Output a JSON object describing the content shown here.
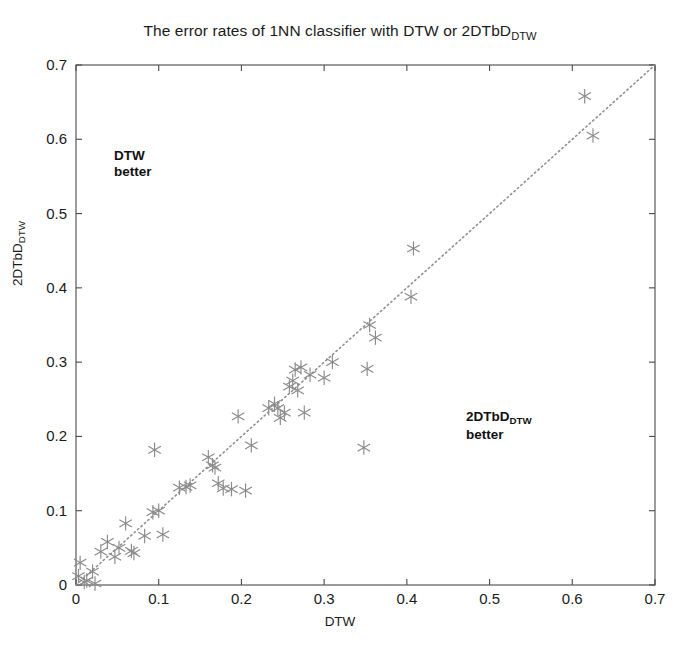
{
  "chart": {
    "title_prefix": "The error rates of 1NN classifier with DTW or 2DTbD",
    "title_sub": "DTW",
    "xlabel": "DTW",
    "ylabel_prefix": "2DTbD",
    "ylabel_sub": "DTW",
    "annotation_upper_line1": "DTW",
    "annotation_upper_line2": "better",
    "annotation_lower_line1_prefix": "2DTbD",
    "annotation_lower_line1_sub": "DTW",
    "annotation_lower_line2": "better",
    "marker_color": "#8a8a8a",
    "axis_color": "#4a4a4a",
    "reference_line_color": "#8f8f8f",
    "background_color": "#ffffff"
  },
  "chart_data": {
    "type": "scatter",
    "xlabel": "DTW",
    "ylabel": "2DTbD_DTW",
    "xlim": [
      0,
      0.7
    ],
    "ylim": [
      0,
      0.7
    ],
    "xticks": [
      "0",
      "0.1",
      "0.2",
      "0.3",
      "0.4",
      "0.5",
      "0.6",
      "0.7"
    ],
    "yticks": [
      "0",
      "0.1",
      "0.2",
      "0.3",
      "0.4",
      "0.5",
      "0.6",
      "0.7"
    ],
    "xtick_values": [
      0,
      0.1,
      0.2,
      0.3,
      0.4,
      0.5,
      0.6,
      0.7
    ],
    "ytick_values": [
      0,
      0.1,
      0.2,
      0.3,
      0.4,
      0.5,
      0.6,
      0.7
    ],
    "grid": false,
    "legend": null,
    "marker": "asterisk",
    "reference_line": {
      "type": "identity",
      "style": "dotted",
      "from": [
        0,
        0
      ],
      "to": [
        0.7,
        0.7
      ]
    },
    "annotations": [
      {
        "text": "DTW better",
        "x": 0.065,
        "y": 0.585
      },
      {
        "text": "2DTbD_DTW better",
        "x": 0.48,
        "y": 0.235
      }
    ],
    "points": [
      [
        0.003,
        0.012
      ],
      [
        0.005,
        0.03
      ],
      [
        0.01,
        0.004
      ],
      [
        0.013,
        0.006
      ],
      [
        0.02,
        0.018
      ],
      [
        0.023,
        0.002
      ],
      [
        0.03,
        0.045
      ],
      [
        0.038,
        0.058
      ],
      [
        0.047,
        0.038
      ],
      [
        0.052,
        0.05
      ],
      [
        0.06,
        0.083
      ],
      [
        0.067,
        0.046
      ],
      [
        0.07,
        0.043
      ],
      [
        0.083,
        0.066
      ],
      [
        0.093,
        0.098
      ],
      [
        0.095,
        0.182
      ],
      [
        0.1,
        0.1
      ],
      [
        0.105,
        0.068
      ],
      [
        0.125,
        0.131
      ],
      [
        0.133,
        0.132
      ],
      [
        0.138,
        0.134
      ],
      [
        0.16,
        0.172
      ],
      [
        0.165,
        0.161
      ],
      [
        0.168,
        0.158
      ],
      [
        0.172,
        0.137
      ],
      [
        0.178,
        0.13
      ],
      [
        0.188,
        0.129
      ],
      [
        0.196,
        0.227
      ],
      [
        0.205,
        0.127
      ],
      [
        0.212,
        0.188
      ],
      [
        0.233,
        0.238
      ],
      [
        0.24,
        0.244
      ],
      [
        0.244,
        0.238
      ],
      [
        0.247,
        0.225
      ],
      [
        0.252,
        0.232
      ],
      [
        0.258,
        0.267
      ],
      [
        0.262,
        0.275
      ],
      [
        0.265,
        0.29
      ],
      [
        0.268,
        0.262
      ],
      [
        0.272,
        0.293
      ],
      [
        0.276,
        0.232
      ],
      [
        0.283,
        0.283
      ],
      [
        0.3,
        0.279
      ],
      [
        0.31,
        0.3
      ],
      [
        0.348,
        0.185
      ],
      [
        0.352,
        0.291
      ],
      [
        0.355,
        0.35
      ],
      [
        0.362,
        0.333
      ],
      [
        0.405,
        0.388
      ],
      [
        0.408,
        0.453
      ],
      [
        0.615,
        0.658
      ],
      [
        0.625,
        0.605
      ]
    ]
  }
}
